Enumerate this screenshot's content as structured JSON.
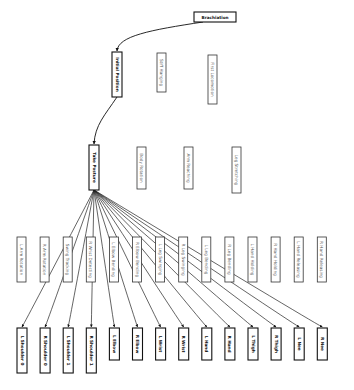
{
  "diagram": {
    "title": "Brachiation",
    "root": {
      "id": "brachiation",
      "label": "Brachiation"
    },
    "level1": [
      {
        "id": "initial-position",
        "label": "Initial Position",
        "bold": true
      },
      {
        "id": "stiff-hanging",
        "label": "Stiff Hanging",
        "bold": false
      },
      {
        "id": "first-locomotion",
        "label": "First Locomotion",
        "bold": false
      }
    ],
    "level2": [
      {
        "id": "take-posture",
        "label": "Take Posture",
        "bold": true
      },
      {
        "id": "body-rotation",
        "label": "Body Rotation",
        "bold": false
      },
      {
        "id": "arm-reaching",
        "label": "Arm Reaching",
        "bold": false
      },
      {
        "id": "leg-stretching",
        "label": "Leg Stretching",
        "bold": false
      }
    ],
    "level3": [
      {
        "id": "l-arm-rotation",
        "label": "L Arm Rotation"
      },
      {
        "id": "r-arm-rotation",
        "label": "R Arm Rotation"
      },
      {
        "id": "swing-tracking",
        "label": "Swing Tracking"
      },
      {
        "id": "r-wrist-detecting",
        "label": "R Wrist Detecting"
      },
      {
        "id": "l-elbow-bending",
        "label": "L Elbow Bending"
      },
      {
        "id": "r-elbow-bending",
        "label": "R Elbow Bending"
      },
      {
        "id": "l-leg-swinging",
        "label": "L Leg Swinging"
      },
      {
        "id": "r-leg-swinging",
        "label": "R Leg Swinging"
      },
      {
        "id": "l-leg-bending",
        "label": "L Leg Bending"
      },
      {
        "id": "r-leg-bending",
        "label": "R Leg Bending"
      },
      {
        "id": "l-hand-holding",
        "label": "L Hand Holding"
      },
      {
        "id": "r-hand-holding",
        "label": "R Hand Holding"
      },
      {
        "id": "l-hand-releasing",
        "label": "L Hand Releasing"
      },
      {
        "id": "r-hand-releasing",
        "label": "R Hand Releasing"
      }
    ],
    "level4": [
      {
        "id": "l-shoulder-0",
        "label": "L Shoulder 0"
      },
      {
        "id": "r-shoulder-0",
        "label": "R Shoulder 0"
      },
      {
        "id": "l-shoulder-1",
        "label": "L Shoulder 1"
      },
      {
        "id": "r-shoulder-1",
        "label": "R Shoulder 1"
      },
      {
        "id": "l-elbow",
        "label": "L Elbow"
      },
      {
        "id": "r-elbow",
        "label": "R Elbow"
      },
      {
        "id": "l-wrist",
        "label": "L Wrist"
      },
      {
        "id": "r-wrist",
        "label": "R Wrist"
      },
      {
        "id": "l-hand",
        "label": "L Hand"
      },
      {
        "id": "r-hand",
        "label": "R Hand"
      },
      {
        "id": "l-thigh",
        "label": "L Thigh"
      },
      {
        "id": "r-thigh",
        "label": "R Thigh"
      },
      {
        "id": "l-nee",
        "label": "L Nee"
      },
      {
        "id": "r-nee",
        "label": "R Nee"
      }
    ],
    "edges": [
      {
        "from": "brachiation",
        "to": "initial-position"
      },
      {
        "from": "initial-position",
        "to": "take-posture"
      },
      {
        "from": "take-posture",
        "to": "l-shoulder-0"
      },
      {
        "from": "take-posture",
        "to": "r-shoulder-0"
      },
      {
        "from": "take-posture",
        "to": "l-shoulder-1"
      },
      {
        "from": "take-posture",
        "to": "r-shoulder-1"
      },
      {
        "from": "take-posture",
        "to": "l-elbow"
      },
      {
        "from": "take-posture",
        "to": "r-elbow"
      },
      {
        "from": "take-posture",
        "to": "l-wrist"
      },
      {
        "from": "take-posture",
        "to": "r-wrist"
      },
      {
        "from": "take-posture",
        "to": "l-hand"
      },
      {
        "from": "take-posture",
        "to": "r-hand"
      },
      {
        "from": "take-posture",
        "to": "l-thigh"
      },
      {
        "from": "take-posture",
        "to": "r-thigh"
      },
      {
        "from": "take-posture",
        "to": "l-nee"
      },
      {
        "from": "take-posture",
        "to": "r-nee"
      }
    ]
  }
}
